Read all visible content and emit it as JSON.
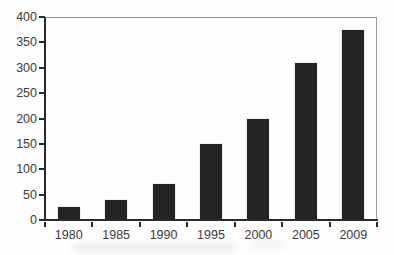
{
  "chart_data": {
    "type": "bar",
    "title": "",
    "xlabel": "",
    "ylabel": "",
    "categories": [
      "1980",
      "1985",
      "1990",
      "1995",
      "2000",
      "2005",
      "2009"
    ],
    "values": [
      25,
      40,
      70,
      150,
      200,
      310,
      375
    ],
    "ylim": [
      0,
      400
    ],
    "yticks": [
      0,
      50,
      100,
      150,
      200,
      250,
      300,
      350,
      400
    ],
    "grid": false,
    "legend": null,
    "colors": {
      "bar": "#242424",
      "axis": "#2a2a2a",
      "frame": "#8c8c8c",
      "labels": "#3b3b3b",
      "background": "#fefefe"
    }
  }
}
